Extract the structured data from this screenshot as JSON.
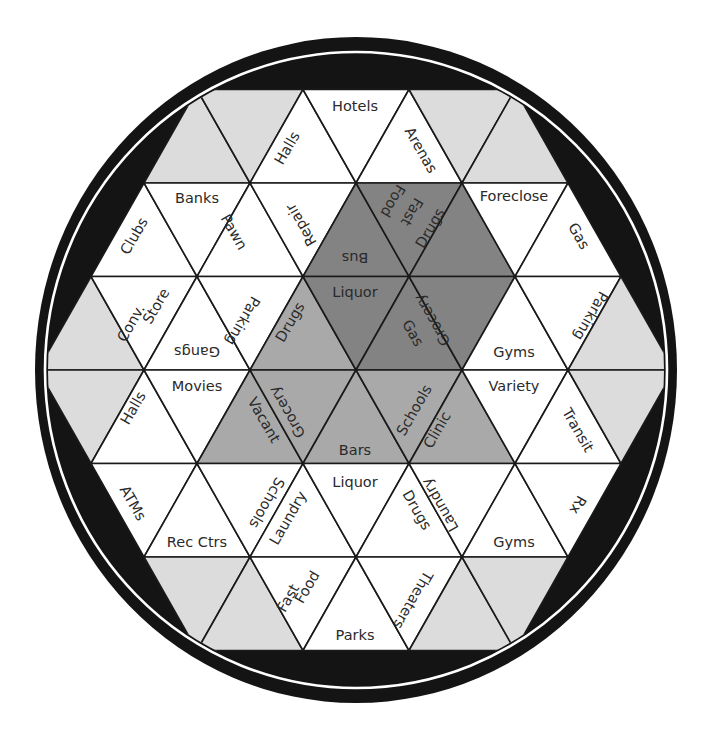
{
  "diagram": {
    "type": "hexagonal-triangle-grid",
    "colors": {
      "background": "#ffffff",
      "outer_ring": "#141414",
      "ring_separator": "#ffffff",
      "white_cell": "#ffffff",
      "light_cell": "#dcdcdc",
      "medium_cell": "#a9a9a9",
      "dark_cell": "#838383",
      "grid_line": "#1a1a1a",
      "text": "#2a2a2a"
    },
    "geometry": {
      "cx": 356,
      "cy": 370,
      "outer_rx": 321,
      "outer_ry": 333,
      "separator_rx": 311,
      "separator_ry": 318,
      "inner_rx": 308,
      "inner_ry": 315,
      "side": 106,
      "row_height": 93.5
    },
    "cells": [
      {
        "row": 1,
        "dir": "up",
        "apex_x": 197,
        "fill": "light"
      },
      {
        "row": 1,
        "dir": "down",
        "apex_x": 250,
        "fill": "light"
      },
      {
        "row": 1,
        "dir": "up",
        "apex_x": 303,
        "fill": "white"
      },
      {
        "row": 1,
        "dir": "down",
        "apex_x": 356,
        "fill": "white"
      },
      {
        "row": 1,
        "dir": "up",
        "apex_x": 409,
        "fill": "white"
      },
      {
        "row": 1,
        "dir": "down",
        "apex_x": 462,
        "fill": "light"
      },
      {
        "row": 1,
        "dir": "up",
        "apex_x": 515,
        "fill": "light"
      },
      {
        "row": 2,
        "dir": "up",
        "apex_x": 144,
        "fill": "white"
      },
      {
        "row": 2,
        "dir": "down",
        "apex_x": 197,
        "fill": "white"
      },
      {
        "row": 2,
        "dir": "up",
        "apex_x": 250,
        "fill": "white"
      },
      {
        "row": 2,
        "dir": "down",
        "apex_x": 303,
        "fill": "white"
      },
      {
        "row": 2,
        "dir": "up",
        "apex_x": 356,
        "fill": "dark"
      },
      {
        "row": 2,
        "dir": "down",
        "apex_x": 409,
        "fill": "dark"
      },
      {
        "row": 2,
        "dir": "up",
        "apex_x": 462,
        "fill": "dark"
      },
      {
        "row": 2,
        "dir": "down",
        "apex_x": 515,
        "fill": "white"
      },
      {
        "row": 2,
        "dir": "up",
        "apex_x": 568,
        "fill": "white"
      },
      {
        "row": 3,
        "dir": "up",
        "apex_x": 91,
        "fill": "light"
      },
      {
        "row": 3,
        "dir": "down",
        "apex_x": 144,
        "fill": "white"
      },
      {
        "row": 3,
        "dir": "up",
        "apex_x": 197,
        "fill": "white"
      },
      {
        "row": 3,
        "dir": "down",
        "apex_x": 250,
        "fill": "white"
      },
      {
        "row": 3,
        "dir": "up",
        "apex_x": 303,
        "fill": "medium"
      },
      {
        "row": 3,
        "dir": "down",
        "apex_x": 356,
        "fill": "dark"
      },
      {
        "row": 3,
        "dir": "up",
        "apex_x": 409,
        "fill": "dark"
      },
      {
        "row": 3,
        "dir": "down",
        "apex_x": 462,
        "fill": "dark"
      },
      {
        "row": 3,
        "dir": "up",
        "apex_x": 515,
        "fill": "white"
      },
      {
        "row": 3,
        "dir": "down",
        "apex_x": 568,
        "fill": "white"
      },
      {
        "row": 3,
        "dir": "up",
        "apex_x": 621,
        "fill": "light"
      },
      {
        "row": 4,
        "dir": "down",
        "apex_x": 91,
        "fill": "light"
      },
      {
        "row": 4,
        "dir": "up",
        "apex_x": 144,
        "fill": "white"
      },
      {
        "row": 4,
        "dir": "down",
        "apex_x": 197,
        "fill": "white"
      },
      {
        "row": 4,
        "dir": "up",
        "apex_x": 250,
        "fill": "medium"
      },
      {
        "row": 4,
        "dir": "down",
        "apex_x": 303,
        "fill": "medium"
      },
      {
        "row": 4,
        "dir": "up",
        "apex_x": 356,
        "fill": "medium"
      },
      {
        "row": 4,
        "dir": "down",
        "apex_x": 409,
        "fill": "medium"
      },
      {
        "row": 4,
        "dir": "up",
        "apex_x": 462,
        "fill": "medium"
      },
      {
        "row": 4,
        "dir": "down",
        "apex_x": 515,
        "fill": "white"
      },
      {
        "row": 4,
        "dir": "up",
        "apex_x": 568,
        "fill": "white"
      },
      {
        "row": 4,
        "dir": "down",
        "apex_x": 621,
        "fill": "light"
      },
      {
        "row": 5,
        "dir": "down",
        "apex_x": 144,
        "fill": "white"
      },
      {
        "row": 5,
        "dir": "up",
        "apex_x": 197,
        "fill": "white"
      },
      {
        "row": 5,
        "dir": "down",
        "apex_x": 250,
        "fill": "white"
      },
      {
        "row": 5,
        "dir": "up",
        "apex_x": 303,
        "fill": "white"
      },
      {
        "row": 5,
        "dir": "down",
        "apex_x": 356,
        "fill": "white"
      },
      {
        "row": 5,
        "dir": "up",
        "apex_x": 409,
        "fill": "white"
      },
      {
        "row": 5,
        "dir": "down",
        "apex_x": 462,
        "fill": "white"
      },
      {
        "row": 5,
        "dir": "up",
        "apex_x": 515,
        "fill": "white"
      },
      {
        "row": 5,
        "dir": "down",
        "apex_x": 568,
        "fill": "white"
      },
      {
        "row": 6,
        "dir": "down",
        "apex_x": 197,
        "fill": "light"
      },
      {
        "row": 6,
        "dir": "up",
        "apex_x": 250,
        "fill": "light"
      },
      {
        "row": 6,
        "dir": "down",
        "apex_x": 303,
        "fill": "white"
      },
      {
        "row": 6,
        "dir": "up",
        "apex_x": 356,
        "fill": "white"
      },
      {
        "row": 6,
        "dir": "down",
        "apex_x": 409,
        "fill": "white"
      },
      {
        "row": 6,
        "dir": "up",
        "apex_x": 462,
        "fill": "light"
      },
      {
        "row": 6,
        "dir": "down",
        "apex_x": 515,
        "fill": "light"
      }
    ],
    "labels": [
      {
        "text": "Hotels",
        "x": 355,
        "y": 106,
        "rot": 0
      },
      {
        "text": "Halls",
        "x": 287,
        "y": 148,
        "rot": -60
      },
      {
        "text": "Arenas",
        "x": 421,
        "y": 150,
        "rot": 60
      },
      {
        "text": "Banks",
        "x": 197,
        "y": 198,
        "rot": 0
      },
      {
        "text": "Clubs",
        "x": 134,
        "y": 236,
        "rot": -60
      },
      {
        "text": "Pawn",
        "x": 234,
        "y": 232,
        "rot": 60
      },
      {
        "text": "Repair",
        "x": 301,
        "y": 225,
        "rot": -120
      },
      {
        "text": "Bus",
        "x": 355,
        "y": 258,
        "rot": 180
      },
      {
        "text": "Fast",
        "x": 412,
        "y": 212,
        "rot": 120
      },
      {
        "text": "Food",
        "x": 393,
        "y": 201,
        "rot": 120
      },
      {
        "text": "Drugs",
        "x": 430,
        "y": 228,
        "rot": -60
      },
      {
        "text": "Foreclose",
        "x": 514,
        "y": 196,
        "rot": 0
      },
      {
        "text": "Gas",
        "x": 579,
        "y": 236,
        "rot": 60
      },
      {
        "text": "Conv.",
        "x": 131,
        "y": 323,
        "rot": -60
      },
      {
        "text": "Store",
        "x": 156,
        "y": 306,
        "rot": -60
      },
      {
        "text": "Gangs",
        "x": 197,
        "y": 352,
        "rot": 180
      },
      {
        "text": "Parking",
        "x": 243,
        "y": 321,
        "rot": 120
      },
      {
        "text": "Drugs",
        "x": 290,
        "y": 322,
        "rot": -60
      },
      {
        "text": "Liquor",
        "x": 355,
        "y": 292,
        "rot": 0
      },
      {
        "text": "Gas",
        "x": 413,
        "y": 333,
        "rot": 60
      },
      {
        "text": "Grocery",
        "x": 432,
        "y": 320,
        "rot": -120
      },
      {
        "text": "Gyms",
        "x": 514,
        "y": 352,
        "rot": 0
      },
      {
        "text": "Parking",
        "x": 591,
        "y": 316,
        "rot": 120
      },
      {
        "text": "Halls",
        "x": 133,
        "y": 408,
        "rot": -60
      },
      {
        "text": "Movies",
        "x": 197,
        "y": 386,
        "rot": 0
      },
      {
        "text": "Vacant",
        "x": 264,
        "y": 420,
        "rot": 60
      },
      {
        "text": "Grocery",
        "x": 287,
        "y": 412,
        "rot": -120
      },
      {
        "text": "Bars",
        "x": 355,
        "y": 450,
        "rot": 0
      },
      {
        "text": "Schools",
        "x": 414,
        "y": 410,
        "rot": -60
      },
      {
        "text": "Clinic",
        "x": 437,
        "y": 430,
        "rot": -60
      },
      {
        "text": "Variety",
        "x": 514,
        "y": 386,
        "rot": 0
      },
      {
        "text": "Transit",
        "x": 578,
        "y": 430,
        "rot": 60
      },
      {
        "text": "ATMs",
        "x": 133,
        "y": 503,
        "rot": 60
      },
      {
        "text": "Rec Ctrs",
        "x": 197,
        "y": 542,
        "rot": 0
      },
      {
        "text": "Schools",
        "x": 267,
        "y": 503,
        "rot": 120
      },
      {
        "text": "Laundry",
        "x": 288,
        "y": 518,
        "rot": -60
      },
      {
        "text": "Liquor",
        "x": 355,
        "y": 482,
        "rot": 0
      },
      {
        "text": "Drugs",
        "x": 417,
        "y": 510,
        "rot": 60
      },
      {
        "text": "Laundry",
        "x": 440,
        "y": 505,
        "rot": -120
      },
      {
        "text": "Gyms",
        "x": 514,
        "y": 542,
        "rot": 0
      },
      {
        "text": "Rx",
        "x": 578,
        "y": 505,
        "rot": 120
      },
      {
        "text": "Fast",
        "x": 288,
        "y": 598,
        "rot": -60
      },
      {
        "text": "Food",
        "x": 307,
        "y": 587,
        "rot": -60
      },
      {
        "text": "Parks",
        "x": 355,
        "y": 635,
        "rot": 0
      },
      {
        "text": "Theaters",
        "x": 413,
        "y": 600,
        "rot": 120
      }
    ]
  }
}
